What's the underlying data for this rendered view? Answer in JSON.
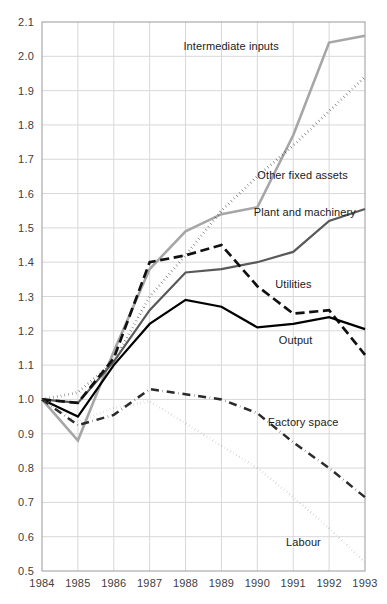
{
  "chart_data": {
    "type": "line",
    "title": "",
    "subtitle": "",
    "xlabel": "",
    "ylabel": "",
    "x": [
      1984,
      1985,
      1986,
      1987,
      1988,
      1989,
      1990,
      1991,
      1992,
      1993
    ],
    "xtick_labels": [
      "1984",
      "1985",
      "1986",
      "1987",
      "1988",
      "1989",
      "1990",
      "1991",
      "1992",
      "1993"
    ],
    "ytick_labels": [
      "0.5",
      "0.6",
      "0.7",
      "0.8",
      "0.9",
      "1.0",
      "1.1",
      "1.2",
      "1.3",
      "1.4",
      "1.5",
      "1.6",
      "1.7",
      "1.8",
      "1.9",
      "2.0",
      "2.1"
    ],
    "ytick_values": [
      0.5,
      0.6,
      0.7,
      0.8,
      0.9,
      1.0,
      1.1,
      1.2,
      1.3,
      1.4,
      1.5,
      1.6,
      1.7,
      1.8,
      1.9,
      2.0,
      2.1
    ],
    "xlim": [
      1984,
      1993
    ],
    "ylim": [
      0.5,
      2.1
    ],
    "grid": true,
    "legend_position": "inline-annotations",
    "series": [
      {
        "name": "Intermediate inputs",
        "style": "solid",
        "color": "#a6a6a6",
        "width": 2.6,
        "values": [
          1.0,
          0.88,
          1.14,
          1.38,
          1.49,
          1.54,
          1.56,
          1.77,
          2.04,
          2.06
        ],
        "label_x": 1990.6,
        "label_y": 2.03,
        "label_anchor": "end"
      },
      {
        "name": "Other fixed assets",
        "style": "dotted",
        "color": "#111111",
        "width": 2.8,
        "values": [
          1.0,
          1.02,
          1.11,
          1.3,
          1.42,
          1.55,
          1.65,
          1.74,
          1.84,
          1.94
        ],
        "label_x": 1990.0,
        "label_y": 1.655,
        "label_anchor": "start"
      },
      {
        "name": "Plant and machinery",
        "style": "solid",
        "color": "#595959",
        "width": 2.2,
        "values": [
          1.0,
          0.99,
          1.11,
          1.26,
          1.37,
          1.38,
          1.4,
          1.43,
          1.52,
          1.555
        ],
        "label_x": 1989.9,
        "label_y": 1.545,
        "label_anchor": "start"
      },
      {
        "name": "Utilities",
        "style": "dashed",
        "color": "#111111",
        "width": 2.7,
        "values": [
          1.0,
          0.99,
          1.12,
          1.4,
          1.42,
          1.45,
          1.33,
          1.25,
          1.26,
          1.13
        ],
        "label_x": 1990.5,
        "label_y": 1.335,
        "label_anchor": "start"
      },
      {
        "name": "Output",
        "style": "solid",
        "color": "#000000",
        "width": 2.2,
        "values": [
          1.0,
          0.95,
          1.1,
          1.22,
          1.29,
          1.27,
          1.21,
          1.22,
          1.24,
          1.205
        ],
        "label_x": 1990.6,
        "label_y": 1.173,
        "label_anchor": "start"
      },
      {
        "name": "Factory space",
        "style": "dashdot",
        "color": "#2b2b2b",
        "width": 2.5,
        "values": [
          1.0,
          0.925,
          0.955,
          1.03,
          1.015,
          1.0,
          0.96,
          0.875,
          0.8,
          0.715
        ],
        "label_x": 1990.3,
        "label_y": 0.933,
        "label_anchor": "start"
      },
      {
        "name": "Labour",
        "style": "finedot",
        "color": "#8c8c8c",
        "width": 2.4,
        "values": [
          1.0,
          0.935,
          0.975,
          0.995,
          0.93,
          0.865,
          0.8,
          0.715,
          0.625,
          0.525
        ],
        "label_x": 1990.8,
        "label_y": 0.585,
        "label_anchor": "start"
      }
    ]
  },
  "axes": {
    "plot_left": 42,
    "plot_right": 365,
    "plot_top": 22,
    "plot_bottom": 571
  }
}
